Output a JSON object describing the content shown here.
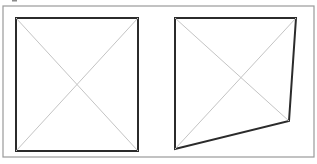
{
  "figure": {
    "colors": {
      "frame": "#9a9a9a",
      "shape_outline": "#2b2b2b",
      "diagonals": "#c4c4c4",
      "background": "#ffffff"
    },
    "outer_frame": {
      "x": 3,
      "y": 6,
      "width": 311,
      "height": 151
    },
    "panels": [
      {
        "name": "rectangle",
        "points": [
          [
            16,
            18
          ],
          [
            138,
            18
          ],
          [
            138,
            151
          ],
          [
            16,
            151
          ]
        ],
        "diagonals": [
          [
            [
              16,
              18
            ],
            [
              138,
              151
            ]
          ],
          [
            [
              138,
              18
            ],
            [
              16,
              151
            ]
          ]
        ]
      },
      {
        "name": "quadrilateral",
        "points": [
          [
            175,
            18
          ],
          [
            296,
            18
          ],
          [
            289,
            121
          ],
          [
            175,
            149
          ]
        ],
        "diagonals": [
          [
            [
              175,
              18
            ],
            [
              289,
              121
            ]
          ],
          [
            [
              296,
              18
            ],
            [
              175,
              149
            ]
          ]
        ]
      }
    ]
  }
}
